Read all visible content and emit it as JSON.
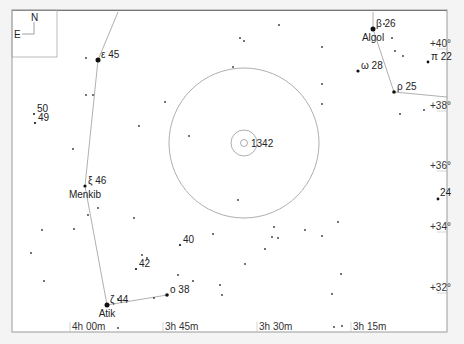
{
  "chart_data": {
    "type": "scatter",
    "title": "",
    "compass": {
      "north_label": "N",
      "east_label": "E"
    },
    "target": {
      "label": "1342",
      "x": 244,
      "y": 143
    },
    "x_tick_labels": [
      {
        "label": "4h 00m",
        "x": 70
      },
      {
        "label": "3h 45m",
        "x": 163
      },
      {
        "label": "3h 30m",
        "x": 257
      },
      {
        "label": "3h 15m",
        "x": 351
      }
    ],
    "y_tick_labels": [
      {
        "label": "+40°",
        "y": 47
      },
      {
        "label": "+38°",
        "y": 109
      },
      {
        "label": "+36°",
        "y": 169
      },
      {
        "label": "+34°",
        "y": 230
      },
      {
        "label": "+32°",
        "y": 291
      }
    ],
    "labeled_stars": [
      {
        "greek": "ε",
        "number": "45",
        "name": "",
        "x": 98,
        "y": 60,
        "r": 2.5
      },
      {
        "greek": "ξ",
        "number": "46",
        "name": "Menkib",
        "x": 85,
        "y": 186,
        "r": 1.6
      },
      {
        "greek": "ζ",
        "number": "44",
        "name": "Atik",
        "x": 107,
        "y": 305,
        "r": 2.5
      },
      {
        "greek": "ο",
        "number": "38",
        "name": "",
        "x": 167,
        "y": 295,
        "r": 1.8
      },
      {
        "greek": "β",
        "number": "26",
        "name": "Algol",
        "x": 373,
        "y": 29,
        "r": 2.5
      },
      {
        "greek": "ω",
        "number": "28",
        "name": "",
        "x": 358,
        "y": 71,
        "r": 1.6
      },
      {
        "greek": "ρ",
        "number": "25",
        "name": "",
        "x": 394,
        "y": 92,
        "r": 1.8
      },
      {
        "greek": "π",
        "number": "22",
        "name": "",
        "x": 428,
        "y": 62,
        "r": 1.4
      },
      {
        "greek": "",
        "number": "50",
        "name": "",
        "x": 34,
        "y": 114,
        "r": 1.0
      },
      {
        "greek": "",
        "number": "49",
        "name": "",
        "x": 35,
        "y": 123,
        "r": 1.1
      },
      {
        "greek": "",
        "number": "40",
        "name": "",
        "x": 180,
        "y": 245,
        "r": 1.1
      },
      {
        "greek": "",
        "number": "42",
        "name": "",
        "x": 136,
        "y": 269,
        "r": 1.1
      },
      {
        "greek": "",
        "number": "24",
        "name": "",
        "x": 438,
        "y": 199,
        "r": 1.4
      }
    ],
    "field_stars": [
      [
        86,
        58
      ],
      [
        86,
        95
      ],
      [
        93,
        95
      ],
      [
        139,
        126
      ],
      [
        165,
        102
      ],
      [
        189,
        136
      ],
      [
        240,
        38
      ],
      [
        244,
        41
      ],
      [
        279,
        25
      ],
      [
        233,
        67
      ],
      [
        322,
        47
      ],
      [
        322,
        84
      ],
      [
        322,
        104
      ],
      [
        384,
        24
      ],
      [
        392,
        38
      ],
      [
        395,
        51
      ],
      [
        403,
        56
      ],
      [
        400,
        114
      ],
      [
        424,
        110
      ],
      [
        73,
        149
      ],
      [
        98,
        208
      ],
      [
        88,
        215
      ],
      [
        134,
        218
      ],
      [
        74,
        229
      ],
      [
        42,
        230
      ],
      [
        31,
        253
      ],
      [
        44,
        281
      ],
      [
        118,
        299
      ],
      [
        147,
        258
      ],
      [
        154,
        298
      ],
      [
        142,
        255
      ],
      [
        178,
        275
      ],
      [
        193,
        281
      ],
      [
        213,
        234
      ],
      [
        238,
        200
      ],
      [
        265,
        249
      ],
      [
        274,
        227
      ],
      [
        272,
        237
      ],
      [
        305,
        230
      ],
      [
        322,
        236
      ],
      [
        338,
        222
      ],
      [
        341,
        274
      ],
      [
        332,
        294
      ],
      [
        342,
        326
      ],
      [
        278,
        238
      ],
      [
        245,
        264
      ],
      [
        220,
        285
      ],
      [
        222,
        295
      ],
      [
        118,
        328
      ],
      [
        334,
        327
      ]
    ],
    "constellation_lines": [
      [
        [
          118,
          12
        ],
        [
          98,
          60
        ],
        [
          85,
          186
        ],
        [
          107,
          305
        ],
        [
          167,
          295
        ]
      ],
      [
        [
          373,
          12
        ],
        [
          373,
          29
        ],
        [
          394,
          92
        ],
        [
          447,
          97
        ]
      ]
    ],
    "circles": [
      {
        "cx": 244,
        "cy": 143,
        "r": 75
      },
      {
        "cx": 244,
        "cy": 143,
        "r": 13
      },
      {
        "cx": 244,
        "cy": 143,
        "r": 3.5
      }
    ]
  }
}
